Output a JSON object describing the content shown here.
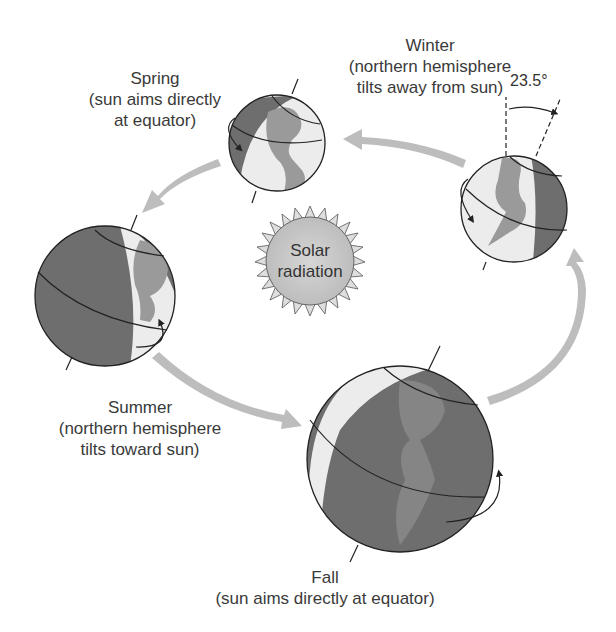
{
  "diagram": {
    "center": {
      "label_line1": "Solar",
      "label_line2": "radiation"
    },
    "tilt_angle": "23.5°",
    "seasons": [
      {
        "name": "Spring",
        "line1": "Spring",
        "line2": "(sun aims directly",
        "line3": "at equator)"
      },
      {
        "name": "Winter",
        "line1": "Winter",
        "line2": "(northern hemisphere",
        "line3": "tilts away from sun)"
      },
      {
        "name": "Summer",
        "line1": "Summer",
        "line2": "(northern hemisphere",
        "line3": "tilts toward sun)"
      },
      {
        "name": "Fall",
        "line1": "Fall",
        "line2": "(sun aims directly at equator)"
      }
    ],
    "colors": {
      "night": "#6e6e6e",
      "day": "#ececec",
      "land_day": "#9a9a9a",
      "land_night": "#858585",
      "arrow": "#bdbdbd",
      "sun_fill": "#c8c8c8",
      "sun_ray": "#dcdcdc",
      "outline": "#222222"
    }
  }
}
